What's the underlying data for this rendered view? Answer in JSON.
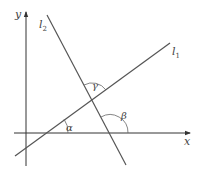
{
  "diagram": {
    "axes": {
      "x_label": "x",
      "y_label": "y"
    },
    "lines": [
      {
        "name": "l",
        "subscript": "1"
      },
      {
        "name": "l",
        "subscript": "2"
      }
    ],
    "angles": {
      "alpha": "α",
      "beta": "β",
      "gamma": "γ"
    },
    "colors": {
      "stroke": "#555555",
      "axis": "#333333",
      "text": "#444444"
    }
  }
}
